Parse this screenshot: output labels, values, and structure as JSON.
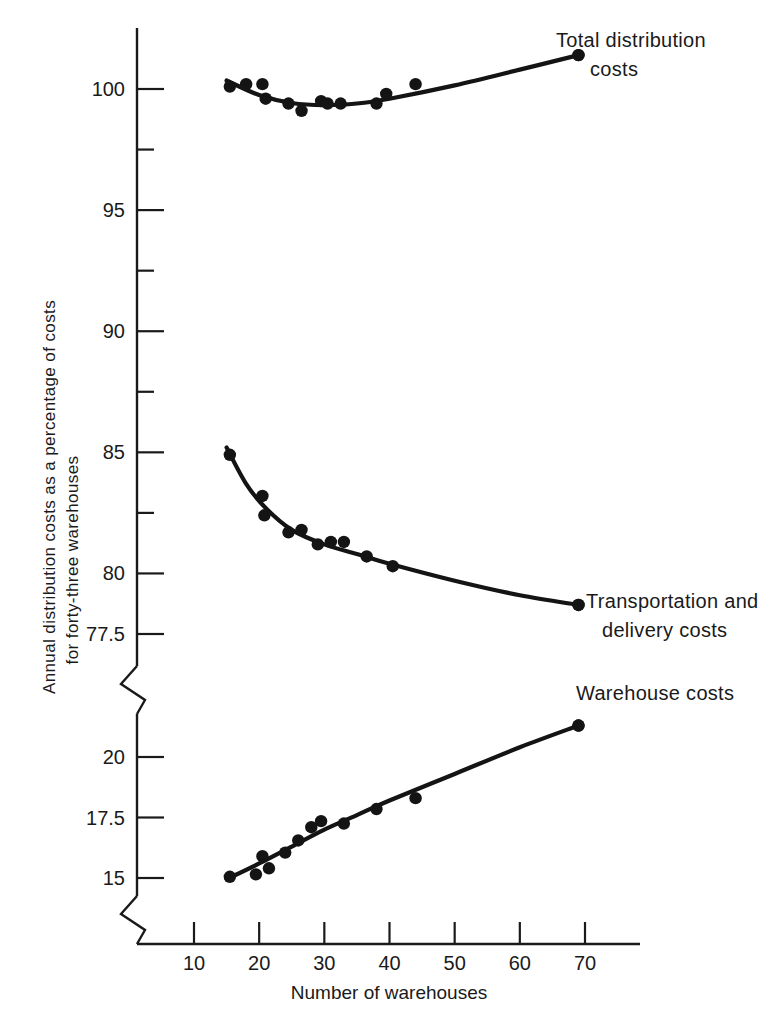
{
  "chart_data": {
    "type": "scatter",
    "title": "",
    "xlabel": "Number of warehouses",
    "ylabel": "Annual distribution costs as a percentage of costs for forty-three warehouses",
    "ylabel_line1": "Annual distribution costs as a percentage of costs",
    "ylabel_line2": "for forty-three warehouses",
    "grid": false,
    "legend_position": "inline-right-annotations",
    "axis_break": true,
    "xlim": [
      0,
      78
    ],
    "x_ticks": [
      10,
      20,
      30,
      40,
      50,
      60,
      70
    ],
    "x_tick_labels": [
      "10",
      "20",
      "30",
      "40",
      "50",
      "60",
      "70"
    ],
    "y_upper_range": [
      77.5,
      101.5
    ],
    "y_upper_major_ticks": [
      100,
      95,
      90,
      85,
      80,
      77.5
    ],
    "y_upper_major_tick_labels": [
      "100",
      "95",
      "90",
      "85",
      "80",
      "77.5"
    ],
    "y_upper_minor_ticks": [
      97.5,
      92.5,
      87.5,
      82.5
    ],
    "y_lower_range": [
      13.5,
      22.5
    ],
    "y_lower_major_ticks": [
      20,
      17.5,
      15
    ],
    "y_lower_major_tick_labels": [
      "20",
      "17.5",
      "15"
    ],
    "series": [
      {
        "name": "Total distribution costs",
        "label_line1": "Total distribution",
        "label_line2": "costs",
        "axis": "upper",
        "points": [
          {
            "x": 15.5,
            "y": 100.1
          },
          {
            "x": 18.0,
            "y": 100.2
          },
          {
            "x": 20.5,
            "y": 100.2
          },
          {
            "x": 21.0,
            "y": 99.6
          },
          {
            "x": 24.5,
            "y": 99.4
          },
          {
            "x": 26.5,
            "y": 99.1
          },
          {
            "x": 29.5,
            "y": 99.5
          },
          {
            "x": 30.5,
            "y": 99.4
          },
          {
            "x": 32.5,
            "y": 99.4
          },
          {
            "x": 38.0,
            "y": 99.4
          },
          {
            "x": 39.5,
            "y": 99.8
          },
          {
            "x": 44.0,
            "y": 100.2
          },
          {
            "x": 69.0,
            "y": 101.4
          }
        ],
        "fitted_curve": [
          {
            "x": 15.0,
            "y": 100.35
          },
          {
            "x": 20.0,
            "y": 99.75
          },
          {
            "x": 25.0,
            "y": 99.42
          },
          {
            "x": 30.0,
            "y": 99.33
          },
          {
            "x": 35.0,
            "y": 99.4
          },
          {
            "x": 40.0,
            "y": 99.6
          },
          {
            "x": 50.0,
            "y": 100.15
          },
          {
            "x": 60.0,
            "y": 100.8
          },
          {
            "x": 69.0,
            "y": 101.4
          }
        ]
      },
      {
        "name": "Transportation and delivery costs",
        "label_line1": "Transportation and",
        "label_line2": "delivery costs",
        "axis": "upper",
        "points": [
          {
            "x": 15.5,
            "y": 84.9
          },
          {
            "x": 20.5,
            "y": 83.2
          },
          {
            "x": 20.8,
            "y": 82.4
          },
          {
            "x": 24.5,
            "y": 81.7
          },
          {
            "x": 26.5,
            "y": 81.8
          },
          {
            "x": 29.0,
            "y": 81.2
          },
          {
            "x": 31.0,
            "y": 81.3
          },
          {
            "x": 33.0,
            "y": 81.3
          },
          {
            "x": 36.5,
            "y": 80.7
          },
          {
            "x": 40.5,
            "y": 80.3
          },
          {
            "x": 69.0,
            "y": 78.7
          }
        ],
        "fitted_curve": [
          {
            "x": 15.0,
            "y": 85.2
          },
          {
            "x": 18.0,
            "y": 83.7
          },
          {
            "x": 21.0,
            "y": 82.7
          },
          {
            "x": 25.0,
            "y": 81.8
          },
          {
            "x": 30.0,
            "y": 81.2
          },
          {
            "x": 35.0,
            "y": 80.8
          },
          {
            "x": 40.0,
            "y": 80.4
          },
          {
            "x": 50.0,
            "y": 79.7
          },
          {
            "x": 60.0,
            "y": 79.1
          },
          {
            "x": 69.0,
            "y": 78.7
          }
        ]
      },
      {
        "name": "Warehouse costs",
        "label_line1": "Warehouse costs",
        "label_line2": "",
        "axis": "lower",
        "points": [
          {
            "x": 15.5,
            "y": 15.05
          },
          {
            "x": 19.5,
            "y": 15.15
          },
          {
            "x": 20.5,
            "y": 15.9
          },
          {
            "x": 21.5,
            "y": 15.4
          },
          {
            "x": 24.0,
            "y": 16.05
          },
          {
            "x": 26.0,
            "y": 16.55
          },
          {
            "x": 28.0,
            "y": 17.1
          },
          {
            "x": 29.5,
            "y": 17.35
          },
          {
            "x": 33.0,
            "y": 17.25
          },
          {
            "x": 38.0,
            "y": 17.85
          },
          {
            "x": 44.0,
            "y": 18.3
          },
          {
            "x": 69.0,
            "y": 21.3
          }
        ],
        "fitted_curve": [
          {
            "x": 15.0,
            "y": 14.95
          },
          {
            "x": 20.0,
            "y": 15.6
          },
          {
            "x": 25.0,
            "y": 16.3
          },
          {
            "x": 30.0,
            "y": 17.0
          },
          {
            "x": 35.0,
            "y": 17.6
          },
          {
            "x": 40.0,
            "y": 18.2
          },
          {
            "x": 50.0,
            "y": 19.3
          },
          {
            "x": 60.0,
            "y": 20.4
          },
          {
            "x": 69.0,
            "y": 21.3
          }
        ]
      }
    ]
  }
}
